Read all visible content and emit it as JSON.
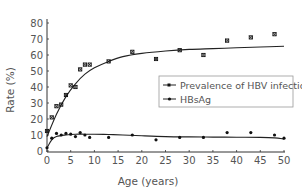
{
  "chart_data": {
    "type": "scatter",
    "title": "",
    "xlabel": "Age (years)",
    "ylabel": "Rate (%)",
    "xlim": [
      0,
      50
    ],
    "ylim": [
      0,
      80
    ],
    "xticks": [
      0,
      5,
      10,
      15,
      20,
      25,
      30,
      35,
      40,
      45,
      50
    ],
    "yticks": [
      0,
      10,
      20,
      30,
      40,
      50,
      60,
      70,
      80
    ],
    "grid": false,
    "legend_position": "center-right",
    "series": [
      {
        "name": "Prevalence of HBV infection",
        "marker": "x-square",
        "x": [
          0,
          1,
          2,
          3,
          4,
          5,
          6,
          7,
          8,
          9,
          13,
          18,
          23,
          28,
          33,
          38,
          43,
          48
        ],
        "values": [
          12.5,
          21,
          28,
          29,
          35,
          41,
          40,
          51,
          54,
          54,
          56,
          62,
          57.5,
          63,
          60,
          69,
          71,
          73
        ],
        "fit_curve": {
          "x": [
            0,
            2,
            4,
            6,
            8,
            10,
            13,
            16,
            20,
            25,
            30,
            35,
            40,
            45,
            50
          ],
          "y": [
            9,
            23,
            34,
            42,
            48,
            52,
            56,
            59,
            61,
            62.5,
            63.5,
            64,
            64.5,
            65,
            65.5
          ]
        }
      },
      {
        "name": "HBsAg",
        "marker": "dot",
        "x": [
          0,
          1,
          2,
          3,
          4,
          5,
          6,
          7,
          8,
          9,
          13,
          18,
          23,
          28,
          33,
          38,
          43,
          48,
          50
        ],
        "values": [
          2,
          8,
          11,
          10,
          11,
          10.5,
          9,
          11.5,
          10,
          8.5,
          8.5,
          10,
          7,
          8.5,
          8.5,
          11.5,
          11.5,
          10,
          8
        ],
        "fit_curve": {
          "x": [
            0,
            1,
            2,
            4,
            6,
            8,
            10,
            13,
            16,
            20,
            25,
            30,
            35,
            40,
            45,
            48,
            50
          ],
          "y": [
            2,
            7,
            9,
            10,
            10.5,
            10.5,
            10.5,
            10.3,
            10,
            9.5,
            9,
            8.8,
            8.7,
            8.6,
            8.5,
            8.2,
            7.5
          ]
        }
      }
    ]
  },
  "legend": {
    "items": [
      {
        "label": "Prevalence of HBV infection"
      },
      {
        "label": "HBsAg"
      }
    ]
  },
  "axes": {
    "xlabel": "Age (years)",
    "ylabel": "Rate (%)"
  },
  "colors": {
    "line": "#222222",
    "marker": "#111111",
    "axis": "#333333",
    "text": "#555555"
  }
}
